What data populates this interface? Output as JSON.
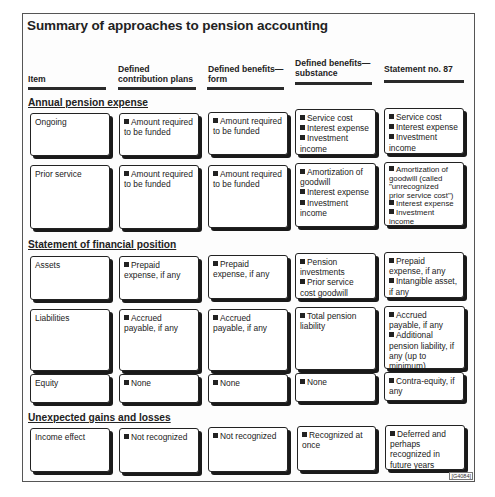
{
  "title": "Summary of approaches to pension accounting",
  "columns": [
    {
      "line1": "",
      "line2": "Item"
    },
    {
      "line1": "Defined",
      "line2": "contribution plans"
    },
    {
      "line1": "Defined benefits—",
      "line2": "form"
    },
    {
      "line1": "Defined benefits—",
      "line2": "substance"
    },
    {
      "line1": "",
      "line2": "Statement no. 87"
    }
  ],
  "sections": {
    "annual": {
      "label": "Annual pension expense",
      "rows": {
        "ongoing": {
          "item": "Ongoing",
          "dc": [
            "Amount required",
            "to be funded"
          ],
          "dbf": [
            "Amount required",
            "to be funded"
          ],
          "dbs": [
            "Service cost",
            "Interest expense",
            "Investment",
            "income"
          ],
          "s87": [
            "Service cost",
            "Interest expense",
            "Investment",
            "income"
          ]
        },
        "prior": {
          "item": "Prior service",
          "dc": [
            "Amount required",
            "to be funded"
          ],
          "dbf": [
            "Amount required",
            "to be funded"
          ],
          "dbs": [
            "Amortization of",
            "goodwill",
            "Interest expense",
            "Investment",
            "income"
          ],
          "s87": [
            "Amortization of",
            "goodwill (called",
            "\"unrecognized",
            "prior service cost\")",
            "Interest expense",
            "Investment",
            "income"
          ]
        }
      }
    },
    "position": {
      "label": "Statement of financial position",
      "rows": {
        "assets": {
          "item": "Assets",
          "dc": [
            "Prepaid",
            "expense, if any"
          ],
          "dbf": [
            "Prepaid",
            "expense, if any"
          ],
          "dbs": [
            "Pension",
            "investments",
            "Prior service",
            "cost goodwill"
          ],
          "s87": [
            "Prepaid",
            "expense, if any",
            "Intangible asset,",
            "if any"
          ]
        },
        "liabilities": {
          "item": "Liabilities",
          "dc": [
            "Accrued",
            "payable, if any"
          ],
          "dbf": [
            "Accrued",
            "payable, if any"
          ],
          "dbs": [
            "Total pension",
            "liability"
          ],
          "s87": [
            "Accrued",
            "payable, if any",
            "Additional",
            "pension liability, if",
            "any (up to minimum)"
          ]
        },
        "equity": {
          "item": "Equity",
          "dc": [
            "None"
          ],
          "dbf": [
            "None"
          ],
          "dbs": [
            "None"
          ],
          "s87": [
            "Contra-equity, if",
            "any"
          ]
        }
      }
    },
    "gains": {
      "label": "Unexpected gains and losses",
      "rows": {
        "income": {
          "item": "Income effect",
          "dc": [
            "Not recognized"
          ],
          "dbf": [
            "Not recognized"
          ],
          "dbs": [
            "Recognized at",
            "once"
          ],
          "s87": [
            "Deferred and",
            "perhaps",
            "recognized in",
            "future years"
          ]
        }
      }
    }
  },
  "figure_code": "[G4084]"
}
